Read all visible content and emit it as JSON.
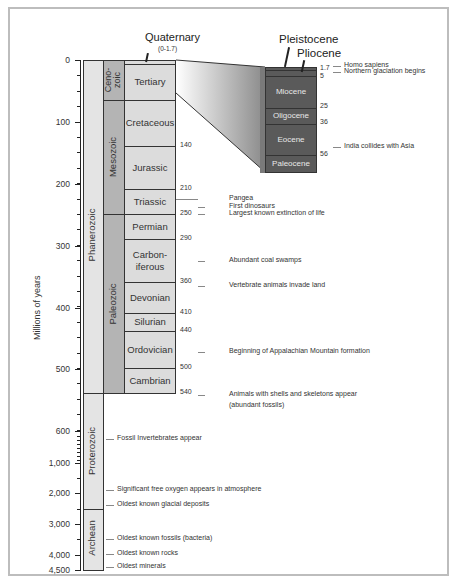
{
  "axis": {
    "label": "Millions of years",
    "ticks": [
      {
        "label": "0",
        "y": 60
      },
      {
        "label": "100",
        "y": 122
      },
      {
        "label": "200",
        "y": 184
      },
      {
        "label": "300",
        "y": 246
      },
      {
        "label": "400",
        "y": 308
      },
      {
        "label": "500",
        "y": 369
      },
      {
        "label": "600",
        "y": 431
      },
      {
        "label": "1,000",
        "y": 463
      },
      {
        "label": "2,000",
        "y": 493
      },
      {
        "label": "3,000",
        "y": 524
      },
      {
        "label": "4,000",
        "y": 555
      },
      {
        "label": "4,500",
        "y": 570
      }
    ]
  },
  "eons": [
    {
      "name": "Phanerozoic",
      "top": 60,
      "bottom": 393
    },
    {
      "name": "Proterozoic",
      "top": 393,
      "bottom": 509
    },
    {
      "name": "Archean",
      "top": 509,
      "bottom": 570
    }
  ],
  "eras": [
    {
      "name": "Ceno-\nzoic",
      "line1": "Ceno-",
      "line2": "zoic",
      "top": 60,
      "bottom": 100
    },
    {
      "name": "Mesozoic",
      "top": 100,
      "bottom": 214
    },
    {
      "name": "Paleozoic",
      "top": 214,
      "bottom": 393
    }
  ],
  "periods": [
    {
      "name": "Quaternary",
      "top": 60,
      "bottom": 64
    },
    {
      "name": "Tertiary",
      "top": 64,
      "bottom": 100
    },
    {
      "name": "Cretaceous",
      "top": 100,
      "bottom": 146
    },
    {
      "name": "Jurassic",
      "top": 146,
      "bottom": 189
    },
    {
      "name": "Triassic",
      "top": 189,
      "bottom": 214
    },
    {
      "name": "Permian",
      "top": 214,
      "bottom": 239
    },
    {
      "name": "Carbon-\niferous",
      "line1": "Carbon-",
      "line2": "iferous",
      "top": 239,
      "bottom": 282
    },
    {
      "name": "Devonian",
      "top": 282,
      "bottom": 313
    },
    {
      "name": "Silurian",
      "top": 313,
      "bottom": 331
    },
    {
      "name": "Ordovician",
      "top": 331,
      "bottom": 368
    },
    {
      "name": "Cambrian",
      "top": 368,
      "bottom": 393
    }
  ],
  "quaternary_label": {
    "title": "Quaternary",
    "range": "(0-1.7)"
  },
  "boundaries": [
    {
      "label": "65",
      "y": 93
    },
    {
      "label": "140",
      "y": 146
    },
    {
      "label": "210",
      "y": 189
    },
    {
      "label": "250",
      "y": 214
    },
    {
      "label": "290",
      "y": 239
    },
    {
      "label": "360",
      "y": 282
    },
    {
      "label": "410",
      "y": 313
    },
    {
      "label": "440",
      "y": 331
    },
    {
      "label": "500",
      "y": 368
    },
    {
      "label": "540",
      "y": 393
    }
  ],
  "events": [
    {
      "text": "Pangea",
      "y": 199
    },
    {
      "text": "First dinosaurs",
      "y": 207
    },
    {
      "text": "Largest known extinction of life",
      "y": 214
    },
    {
      "text": "Abundant coal swamps",
      "y": 261
    },
    {
      "text": "Vertebrate animals invade land",
      "y": 286
    },
    {
      "text": "Beginning of Appalachian Mountain formation",
      "y": 352
    },
    {
      "text": "Animals with shells and skeletons appear",
      "y": 395
    },
    {
      "text": "(abundant fossils)",
      "y": 406
    },
    {
      "text": "Fossil Invertebrates appear",
      "y": 439
    },
    {
      "text": "Significant free oxygen appears in atmosphere",
      "y": 490
    },
    {
      "text": "Oldest known glacial deposits",
      "y": 505
    },
    {
      "text": "Oldest known fossils (bacteria)",
      "y": 539
    },
    {
      "text": "Oldest known rocks",
      "y": 554
    },
    {
      "text": "Oldest minerals",
      "y": 567
    }
  ],
  "cenozoic_detail": {
    "titles": {
      "pleistocene": "Pleistocene",
      "pliocene": "Pliocene"
    },
    "epochs": [
      {
        "name": "Pleistocene",
        "top": 67,
        "bottom": 70
      },
      {
        "name": "Pliocene",
        "top": 70,
        "bottom": 76
      },
      {
        "name": "Miocene",
        "top": 76,
        "bottom": 108
      },
      {
        "name": "Oligocene",
        "top": 108,
        "bottom": 124
      },
      {
        "name": "Eocene",
        "top": 124,
        "bottom": 155
      },
      {
        "name": "Paleocene",
        "top": 155,
        "bottom": 172
      }
    ],
    "boundaries": [
      {
        "label": "1.7",
        "y": 69
      },
      {
        "label": "5",
        "y": 77
      },
      {
        "label": "25",
        "y": 107
      },
      {
        "label": "36",
        "y": 123
      },
      {
        "label": "56",
        "y": 155
      }
    ],
    "events": [
      {
        "text": "Homo sapiens",
        "y": 66
      },
      {
        "text": "Northern glaciation begins",
        "y": 72
      },
      {
        "text": "India collides with Asia",
        "y": 147
      }
    ]
  },
  "colors": {
    "eon_fill": "#e4e4e4",
    "era_fill": "#b4b4b4",
    "period_fill": "#dcdcdc",
    "epoch_fill": "#5a5a5a",
    "border": "#333333"
  }
}
